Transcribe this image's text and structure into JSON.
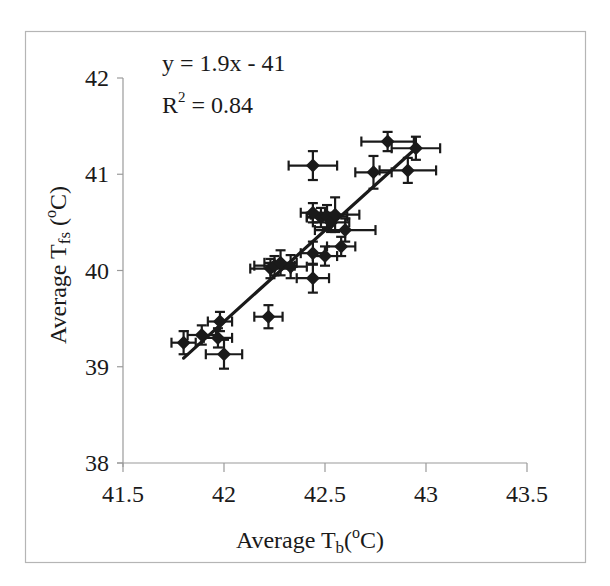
{
  "chart_data": {
    "type": "scatter",
    "title": "",
    "xlabel": "Average Tb(oC)",
    "ylabel": "Average Tfs (oC)",
    "xlabel_parts": {
      "main": "Average T",
      "sub": "b",
      "tail_open": "(",
      "sup": "o",
      "tail_close": "C)"
    },
    "ylabel_parts": {
      "main": "Average T",
      "sub": "fs",
      "tail_open": " (",
      "sup": "o",
      "tail_close": "C)"
    },
    "xlim": [
      41.5,
      43.5
    ],
    "ylim": [
      38,
      42
    ],
    "xticks": [
      41.5,
      42,
      42.5,
      43,
      43.5
    ],
    "yticks": [
      38,
      39,
      40,
      41,
      42
    ],
    "grid": false,
    "legend": null,
    "annotations": {
      "equation": "y = 1.9x - 41",
      "r2_prefix": "R",
      "r2_sup": "2",
      "r2_suffix": " = 0.84"
    },
    "trendline": {
      "slope": 1.9,
      "intercept": -41,
      "r2": 0.84,
      "x_start": 41.8,
      "x_end": 42.95,
      "y_start": 39.09,
      "y_end": 41.27
    },
    "marker": "diamond",
    "color": "#1a1a1a",
    "points": [
      {
        "x": 41.8,
        "y": 39.25,
        "xerr": 0.06,
        "yerr": 0.12
      },
      {
        "x": 41.89,
        "y": 39.33,
        "xerr": 0.07,
        "yerr": 0.1
      },
      {
        "x": 41.98,
        "y": 39.47,
        "xerr": 0.06,
        "yerr": 0.1
      },
      {
        "x": 41.97,
        "y": 39.3,
        "xerr": 0.07,
        "yerr": 0.1
      },
      {
        "x": 42.0,
        "y": 39.13,
        "xerr": 0.09,
        "yerr": 0.15
      },
      {
        "x": 42.22,
        "y": 39.52,
        "xerr": 0.07,
        "yerr": 0.12
      },
      {
        "x": 42.23,
        "y": 40.02,
        "xerr": 0.1,
        "yerr": 0.1
      },
      {
        "x": 42.25,
        "y": 40.05,
        "xerr": 0.1,
        "yerr": 0.1
      },
      {
        "x": 42.28,
        "y": 40.08,
        "xerr": 0.08,
        "yerr": 0.13
      },
      {
        "x": 42.33,
        "y": 40.04,
        "xerr": 0.08,
        "yerr": 0.12
      },
      {
        "x": 42.44,
        "y": 40.18,
        "xerr": 0.06,
        "yerr": 0.12
      },
      {
        "x": 42.44,
        "y": 39.92,
        "xerr": 0.08,
        "yerr": 0.15
      },
      {
        "x": 42.5,
        "y": 40.15,
        "xerr": 0.06,
        "yerr": 0.1
      },
      {
        "x": 42.58,
        "y": 40.25,
        "xerr": 0.07,
        "yerr": 0.1
      },
      {
        "x": 42.44,
        "y": 40.6,
        "xerr": 0.06,
        "yerr": 0.1
      },
      {
        "x": 42.48,
        "y": 40.55,
        "xerr": 0.07,
        "yerr": 0.1
      },
      {
        "x": 42.51,
        "y": 40.56,
        "xerr": 0.1,
        "yerr": 0.12
      },
      {
        "x": 42.53,
        "y": 40.5,
        "xerr": 0.09,
        "yerr": 0.1
      },
      {
        "x": 42.55,
        "y": 40.58,
        "xerr": 0.12,
        "yerr": 0.18
      },
      {
        "x": 42.6,
        "y": 40.42,
        "xerr": 0.15,
        "yerr": 0.12
      },
      {
        "x": 42.44,
        "y": 41.09,
        "xerr": 0.12,
        "yerr": 0.15
      },
      {
        "x": 42.74,
        "y": 41.02,
        "xerr": 0.09,
        "yerr": 0.17
      },
      {
        "x": 42.91,
        "y": 41.04,
        "xerr": 0.14,
        "yerr": 0.13
      },
      {
        "x": 42.81,
        "y": 41.34,
        "xerr": 0.13,
        "yerr": 0.1
      },
      {
        "x": 42.95,
        "y": 41.27,
        "xerr": 0.12,
        "yerr": 0.12
      }
    ]
  }
}
